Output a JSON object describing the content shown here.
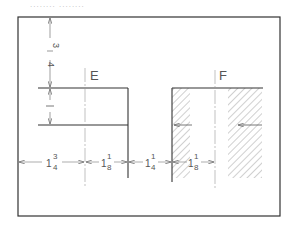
{
  "header": {
    "caption_fragment": "........  ........"
  },
  "colors": {
    "line": "#333333",
    "thin": "#777777",
    "hatch": "#888888",
    "background": "#ffffff"
  },
  "views": [
    {
      "label": "E",
      "type": "unsectioned"
    },
    {
      "label": "F",
      "type": "sectioned-hatched"
    }
  ],
  "vertical_dimensions": [
    {
      "whole": "",
      "numerator": "3",
      "denominator": "4",
      "display": "3/4"
    },
    {
      "whole": "1",
      "numerator": "",
      "denominator": "",
      "display": "1"
    }
  ],
  "horizontal_dimensions": [
    {
      "whole": "1",
      "numerator": "3",
      "denominator": "4",
      "display": "1 3/4"
    },
    {
      "whole": "1",
      "numerator": "1",
      "denominator": "8",
      "display": "1 1/8"
    },
    {
      "whole": "1",
      "numerator": "1",
      "denominator": "4",
      "display": "1 1/4"
    },
    {
      "whole": "1",
      "numerator": "1",
      "denominator": "8",
      "display": "1 1/8"
    }
  ]
}
